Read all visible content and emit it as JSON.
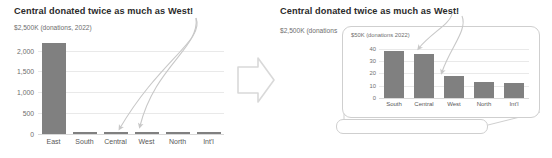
{
  "left_panel": {
    "title": "Central donated twice as much as West!",
    "ylabel": "$2,500K (donations, 2022)"
  },
  "right_panel": {
    "title": "Central donated twice as much as West!",
    "ylabel": "$2,500K (donations"
  },
  "inset": {
    "ylabel": "$50K (donations 2022)"
  },
  "chart_data": [
    {
      "type": "bar",
      "title": "Central donated twice as much as West!",
      "xlabel": "",
      "ylabel": "$2,500K (donations, 2022)",
      "categories": [
        "East",
        "South",
        "Central",
        "West",
        "North",
        "Int'l"
      ],
      "values": [
        2180,
        38,
        36,
        18,
        13,
        12
      ],
      "yticks": [
        "0",
        "500",
        "1,000",
        "1,500",
        "2,000"
      ],
      "ytick_values": [
        0,
        500,
        1000,
        1500,
        2000
      ],
      "ylim": [
        0,
        2300
      ],
      "grid": true,
      "legend": "none",
      "bar_color": "#808080",
      "annotations": [
        {
          "text": "arrow from title to Central bar",
          "target": "Central"
        },
        {
          "text": "arrow from title to West bar",
          "target": "West"
        }
      ]
    },
    {
      "type": "bar",
      "title": "Central donated twice as much as West!",
      "xlabel": "",
      "ylabel": "$50K (donations 2022)",
      "categories": [
        "South",
        "Central",
        "West",
        "North",
        "Int'l"
      ],
      "values": [
        38,
        36,
        18,
        13,
        12
      ],
      "yticks": [
        "0",
        "10",
        "20",
        "30",
        "40"
      ],
      "ytick_values": [
        0,
        10,
        20,
        30,
        40
      ],
      "ylim": [
        0,
        44
      ],
      "grid": true,
      "legend": "none",
      "bar_color": "#808080",
      "annotations": [
        {
          "text": "arrow from title to Central bar",
          "target": "Central"
        },
        {
          "text": "arrow from title to West bar",
          "target": "West"
        }
      ]
    }
  ],
  "icons": {
    "transition_arrow": "right-arrow-icon"
  },
  "colors": {
    "bar": "#808080",
    "grid": "#e9e9e9",
    "axis_text": "#6e6e6e",
    "title_text": "#2b2b2b",
    "annotation": "#c8c8c8",
    "callout_border": "#cfcfcf"
  }
}
